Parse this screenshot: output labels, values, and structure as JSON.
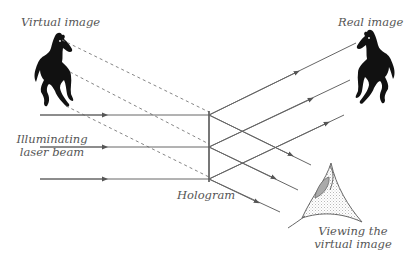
{
  "diagram": {
    "type": "hologram-reconstruction",
    "labels": {
      "virtual_image": "Virtual image",
      "real_image": "Real image",
      "illuminating_line1": "Illuminating",
      "illuminating_line2": "laser beam",
      "hologram": "Hologram",
      "viewing_line1": "Viewing the",
      "viewing_line2": "virtual image"
    },
    "colors": {
      "line": "#666666",
      "silhouette": "#111111",
      "text": "#555555",
      "pupil": "#aaaaaa",
      "stipple": "#bbbbbb"
    },
    "nodes": [
      {
        "id": "virtual-horse",
        "label": "Virtual image"
      },
      {
        "id": "laser-beams",
        "label": "Illuminating laser beam",
        "count": 3
      },
      {
        "id": "hologram",
        "label": "Hologram"
      },
      {
        "id": "real-horse",
        "label": "Real image"
      },
      {
        "id": "eye",
        "label": "Viewing the virtual image"
      }
    ],
    "edges": [
      {
        "from": "laser-beams",
        "to": "hologram",
        "style": "solid-arrow"
      },
      {
        "from": "hologram",
        "to": "real-horse",
        "style": "solid-arrow"
      },
      {
        "from": "hologram",
        "to": "eye",
        "style": "solid-arrow"
      },
      {
        "from": "virtual-horse",
        "to": "hologram",
        "style": "dashed"
      }
    ]
  }
}
